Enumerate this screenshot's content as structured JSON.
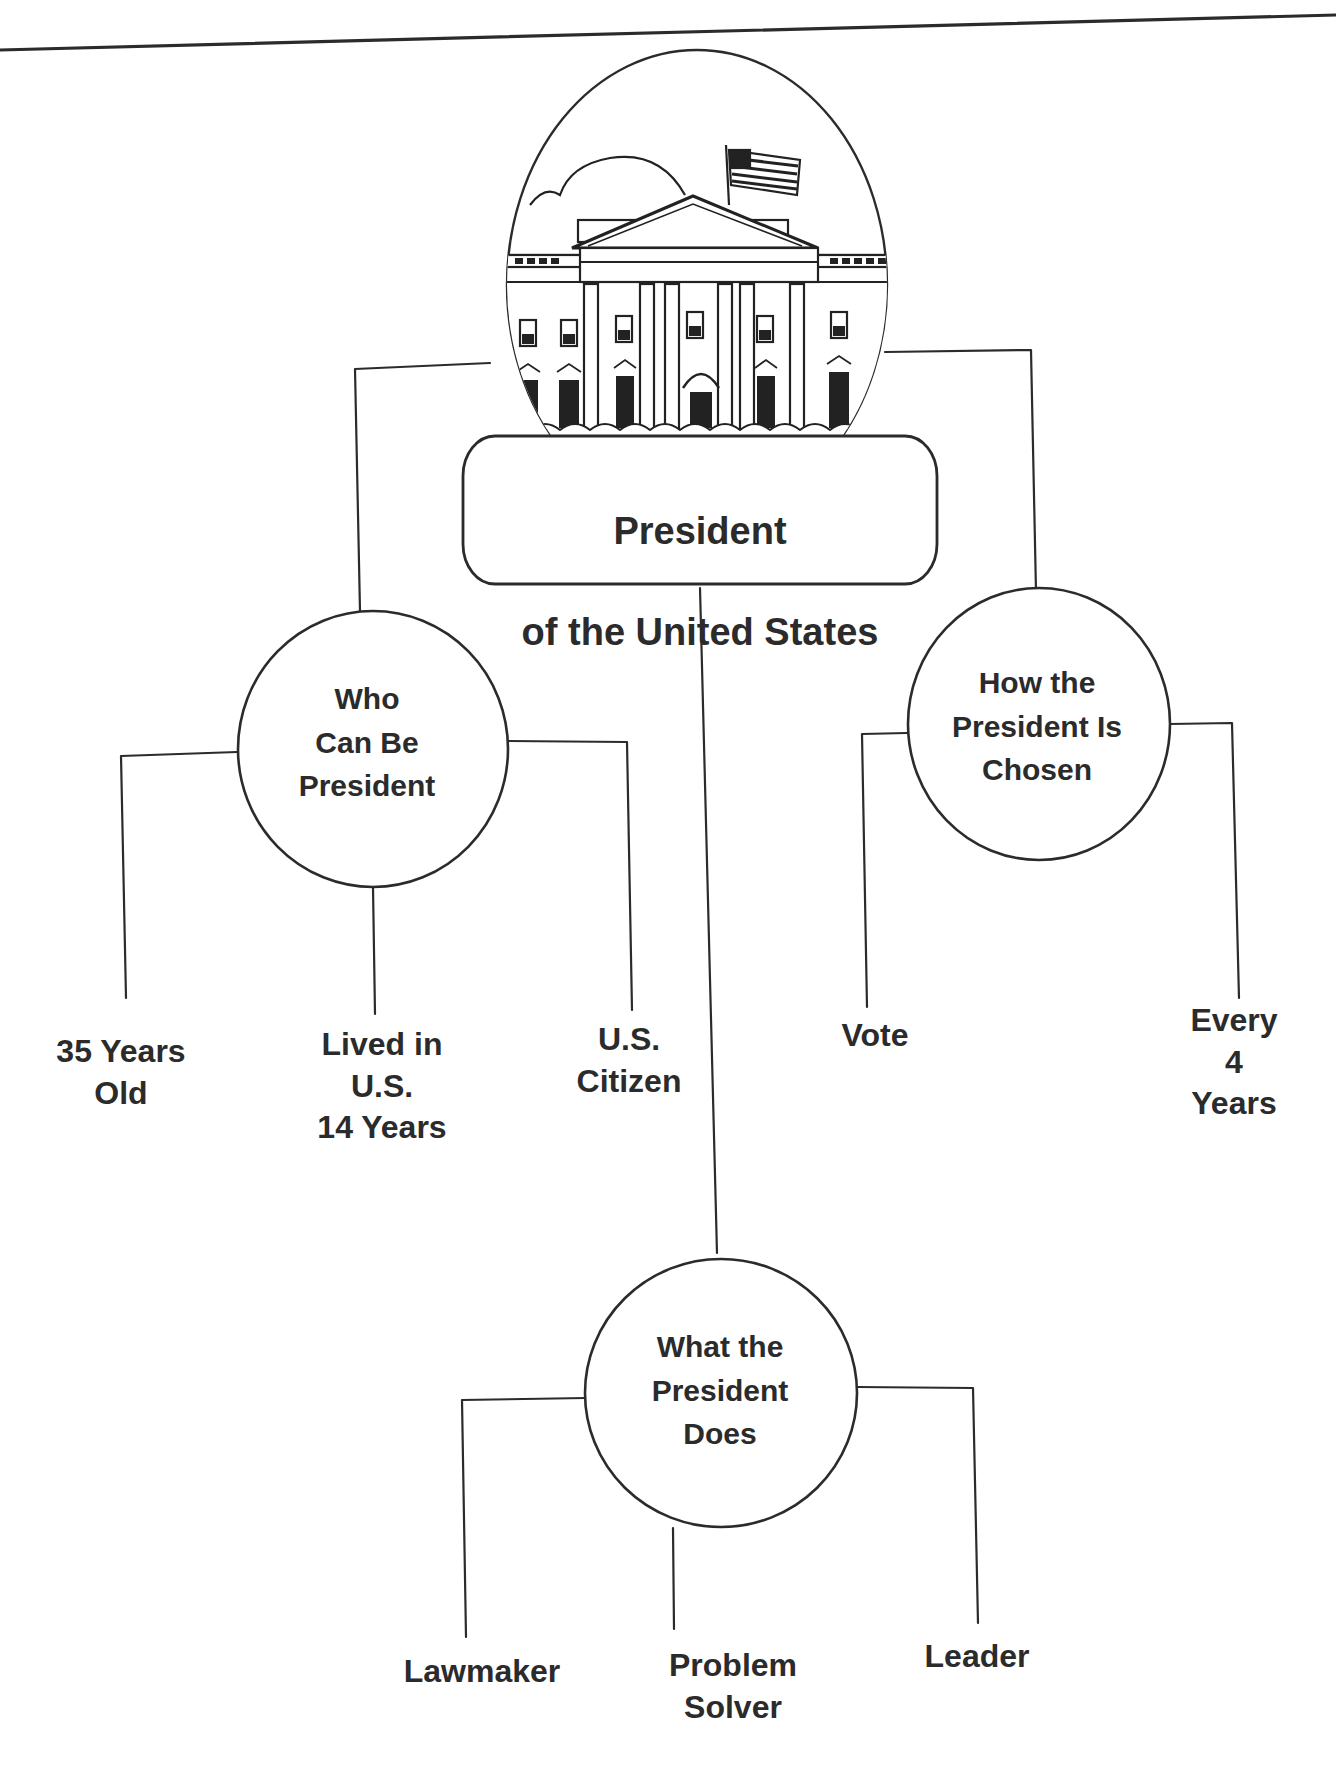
{
  "diagram": {
    "type": "concept-map",
    "root": {
      "label_line1": "President",
      "label_line2": "of the United States",
      "illustration": "white-house-icon"
    },
    "branches": [
      {
        "label": "Who\nCan Be\nPresident",
        "children": [
          "35 Years\nOld",
          "Lived in\nU.S.\n14 Years",
          "U.S.\nCitizen"
        ]
      },
      {
        "label": "How the\nPresident Is\nChosen",
        "children": [
          "Vote",
          "Every\n4 Years"
        ]
      },
      {
        "label": "What the\nPresident\nDoes",
        "children": [
          "Lawmaker",
          "Problem\nSolver",
          "Leader"
        ]
      }
    ],
    "colors": {
      "ink": "#2b2b2b",
      "background": "#ffffff"
    }
  }
}
